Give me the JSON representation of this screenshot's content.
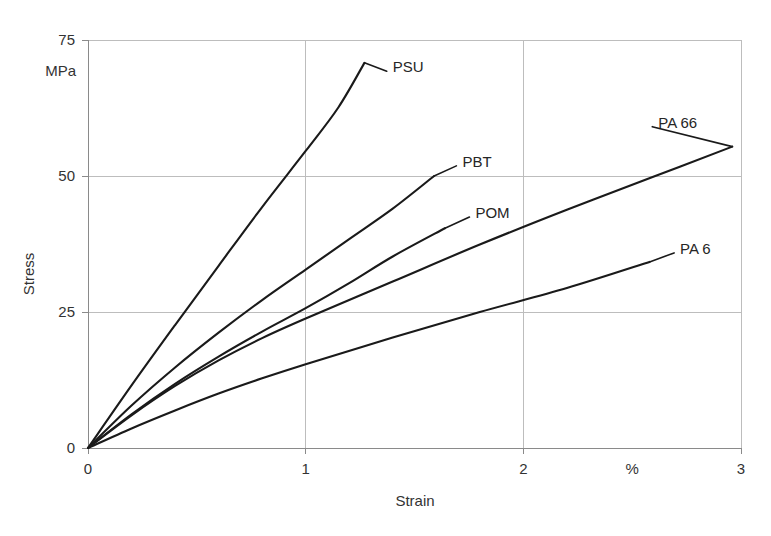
{
  "chart_data": {
    "type": "line",
    "title": "",
    "subtitle": "",
    "xlabel": "Strain",
    "ylabel": "Stress",
    "x_unit": "%",
    "y_unit": "MPa",
    "xlim": [
      0,
      3
    ],
    "ylim": [
      0,
      75
    ],
    "x_ticks": [
      0,
      1,
      2,
      3
    ],
    "x_tick_labels": [
      "0",
      "1",
      "2",
      "3"
    ],
    "y_ticks": [
      0,
      25,
      50,
      75
    ],
    "y_tick_labels": [
      "0",
      "25",
      "50",
      "75"
    ],
    "x_unit_position": 2.5,
    "grid": true,
    "legend": "inline-end-labels",
    "series": [
      {
        "name": "PSU",
        "label": "PSU",
        "color": "#1a1a1a",
        "points": [
          [
            0.0,
            0.0
          ],
          [
            0.2,
            11.5
          ],
          [
            0.4,
            22.6
          ],
          [
            0.6,
            33.5
          ],
          [
            0.8,
            44.3
          ],
          [
            1.0,
            54.6
          ],
          [
            1.15,
            62.6
          ],
          [
            1.27,
            70.8
          ]
        ],
        "end_point": [
          1.27,
          70.8
        ],
        "label_x": 1.4,
        "label_y": 70.0
      },
      {
        "name": "PBT",
        "label": "PBT",
        "color": "#1a1a1a",
        "points": [
          [
            0.0,
            0.0
          ],
          [
            0.2,
            7.8
          ],
          [
            0.4,
            14.8
          ],
          [
            0.6,
            21.2
          ],
          [
            0.8,
            27.2
          ],
          [
            1.0,
            32.8
          ],
          [
            1.2,
            38.4
          ],
          [
            1.4,
            44.0
          ],
          [
            1.59,
            50.0
          ]
        ],
        "end_point": [
          1.59,
          50.0
        ],
        "label_x": 1.72,
        "label_y": 52.6
      },
      {
        "name": "POM",
        "label": "POM",
        "color": "#1a1a1a",
        "points": [
          [
            0.0,
            0.0
          ],
          [
            0.2,
            6.2
          ],
          [
            0.4,
            11.8
          ],
          [
            0.6,
            16.8
          ],
          [
            0.8,
            21.4
          ],
          [
            1.0,
            25.7
          ],
          [
            1.2,
            30.3
          ],
          [
            1.4,
            35.2
          ],
          [
            1.64,
            40.4
          ]
        ],
        "end_point": [
          1.64,
          40.4
        ],
        "label_x": 1.78,
        "label_y": 43.2
      },
      {
        "name": "PA 66",
        "label": "PA 66",
        "color": "#1a1a1a",
        "points": [
          [
            0.0,
            0.0
          ],
          [
            0.2,
            6.0
          ],
          [
            0.4,
            11.4
          ],
          [
            0.6,
            16.1
          ],
          [
            0.8,
            20.2
          ],
          [
            1.0,
            23.8
          ],
          [
            1.4,
            30.6
          ],
          [
            1.8,
            37.4
          ],
          [
            2.2,
            43.8
          ],
          [
            2.6,
            49.9
          ],
          [
            2.96,
            55.4
          ]
        ],
        "end_point": [
          2.96,
          55.4
        ],
        "label_x": 2.62,
        "label_y": 59.8
      },
      {
        "name": "PA 6",
        "label": "PA 6",
        "color": "#1a1a1a",
        "points": [
          [
            0.0,
            0.0
          ],
          [
            0.2,
            3.6
          ],
          [
            0.4,
            6.9
          ],
          [
            0.6,
            10.0
          ],
          [
            0.8,
            12.8
          ],
          [
            1.0,
            15.4
          ],
          [
            1.4,
            20.3
          ],
          [
            1.8,
            25.0
          ],
          [
            2.2,
            29.4
          ],
          [
            2.58,
            34.2
          ]
        ],
        "end_point": [
          2.58,
          34.2
        ],
        "label_x": 2.72,
        "label_y": 36.6
      }
    ]
  },
  "geometry": {
    "plot_left": 88,
    "plot_right": 741,
    "plot_top": 40,
    "plot_bottom": 448
  },
  "colors": {
    "curve": "#1a1a1a",
    "grid": "#bdbdbd",
    "axis": "#8a8a8a",
    "text": "#333333",
    "background": "#ffffff"
  }
}
